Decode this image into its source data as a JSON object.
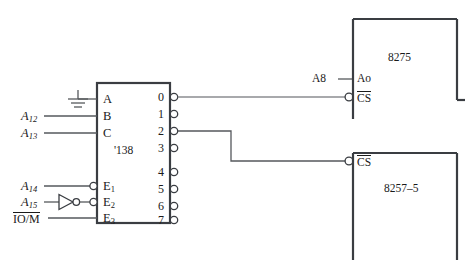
{
  "diagram": {
    "colors": {
      "wire": "#55585c",
      "outline": "#3a3d42",
      "text": "#1a1a1a",
      "background": "#ffffff"
    }
  },
  "decoder": {
    "chip_label": "'138",
    "inputs": [
      {
        "pin": "A",
        "source": "ground-symbol",
        "bubble": false
      },
      {
        "pin": "B",
        "source": "A12",
        "bubble": false
      },
      {
        "pin": "C",
        "source": "A13",
        "bubble": false
      }
    ],
    "enables": [
      {
        "pin": "E",
        "sub": "1",
        "source": "A14",
        "bubble": true,
        "inverter": false
      },
      {
        "pin": "E",
        "sub": "2",
        "source": "A15",
        "bubble": true,
        "inverter": true
      },
      {
        "pin": "E",
        "sub": "3",
        "source": "IO/M",
        "bubble": false,
        "inverter": false
      }
    ],
    "outputs": [
      {
        "label": "0",
        "connected": true,
        "target": "8275-CS"
      },
      {
        "label": "1",
        "connected": false,
        "target": ""
      },
      {
        "label": "2",
        "connected": true,
        "target": "8257-5-CS"
      },
      {
        "label": "3",
        "connected": false,
        "target": ""
      },
      {
        "label": "4",
        "connected": false,
        "target": ""
      },
      {
        "label": "5",
        "connected": false,
        "target": ""
      },
      {
        "label": "6",
        "connected": false,
        "target": ""
      },
      {
        "label": "7",
        "connected": false,
        "target": ""
      }
    ]
  },
  "signals": {
    "a12": "A",
    "a12_sub": "12",
    "a13": "A",
    "a13_sub": "13",
    "a14": "A",
    "a14_sub": "14",
    "a15": "A",
    "a15_sub": "15",
    "iom": "IO/M",
    "a8": "A8"
  },
  "pins": {
    "a_label": "A",
    "b_label": "B",
    "c_label": "C",
    "e_label": "E",
    "e1_sub": "1",
    "e2_sub": "2",
    "e3_sub": "3",
    "ao_label": "Ao",
    "cs_label": "CS"
  },
  "chips": [
    {
      "name": "8275",
      "pins": [
        "Ao",
        "CS"
      ]
    },
    {
      "name": "8257–5",
      "pins": [
        "CS"
      ]
    }
  ],
  "chip_top": {
    "name": "8275"
  },
  "chip_bottom": {
    "name": "8257–5"
  },
  "icons": {
    "ground": "ground-icon",
    "inverter": "inverter-gate-icon",
    "bubble": "inversion-bubble-icon"
  }
}
